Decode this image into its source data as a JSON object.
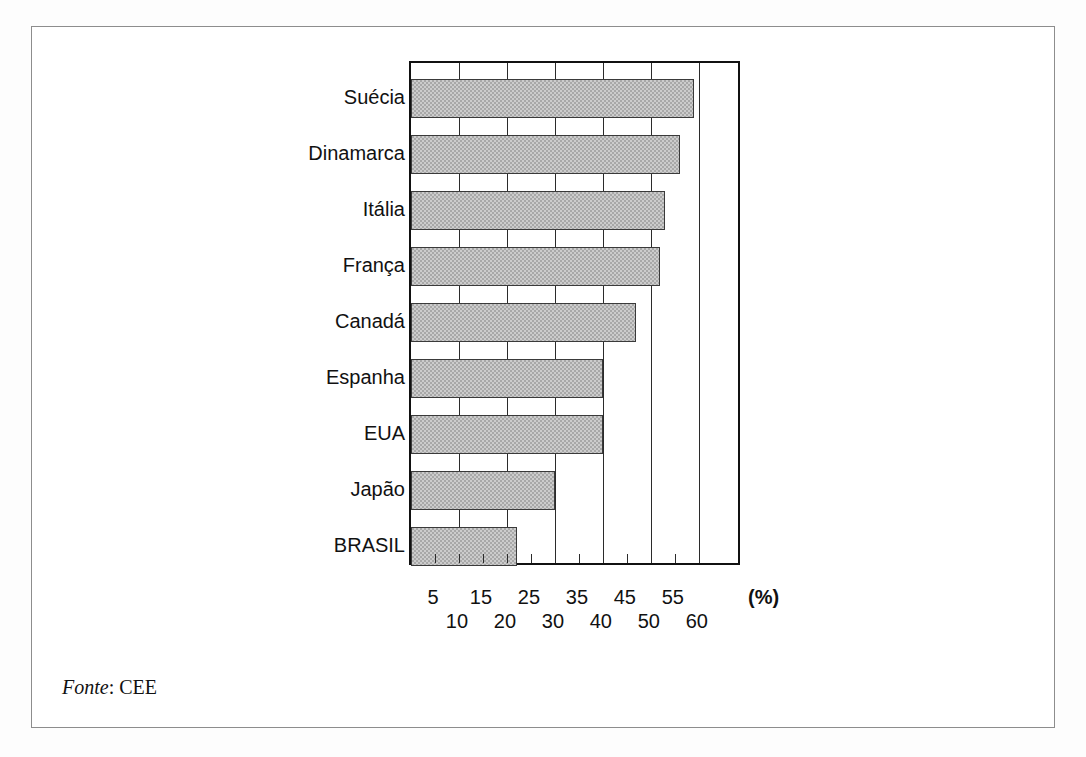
{
  "figure": {
    "source_label": "Fonte",
    "source_separator": ": ",
    "source_value": "CEE",
    "unit_label": "(%)"
  },
  "chart_data": {
    "type": "bar",
    "orientation": "horizontal",
    "title": "",
    "subtitle": "",
    "xlabel": "(%)",
    "ylabel": "",
    "categories": [
      "Suécia",
      "Dinamarca",
      "Itália",
      "França",
      "Canadá",
      "Espanha",
      "EUA",
      "Japão",
      "BRASIL"
    ],
    "values": [
      59,
      56,
      53,
      52,
      47,
      40,
      40,
      30,
      22
    ],
    "xlim": [
      0,
      69
    ],
    "xticks": [
      5,
      10,
      15,
      20,
      25,
      30,
      35,
      40,
      45,
      50,
      55,
      60
    ],
    "xtick_labels_row_odd": [
      "5",
      "15",
      "25",
      "35",
      "45",
      "55"
    ],
    "xtick_labels_row_even": [
      "10",
      "20",
      "30",
      "40",
      "50",
      "60"
    ],
    "gridlines_major": [
      10,
      20,
      30,
      40,
      50,
      60
    ],
    "grid": true,
    "legend": null,
    "legend_position": "none",
    "bar_fill": "#a8a8a8",
    "bar_edge": "#3a3a3a",
    "axis_color": "#111111"
  }
}
